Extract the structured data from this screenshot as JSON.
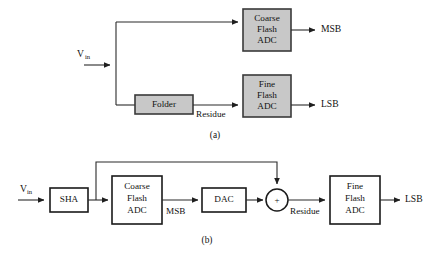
{
  "figure": {
    "background_color": "#ffffff",
    "line_color": "#2b2b2b",
    "gray_fill": "#c8c8c8",
    "white_fill": "#ffffff"
  },
  "diagram_a": {
    "caption": "(a)",
    "input_label": "V",
    "input_subscript": "in",
    "blocks": {
      "coarse": {
        "line1": "Coarse",
        "line2": "Flash",
        "line3": "ADC"
      },
      "fine": {
        "line1": "Fine",
        "line2": "Flash",
        "line3": "ADC"
      },
      "folder": {
        "line1": "Folder"
      }
    },
    "wire_labels": {
      "residue": "Residue"
    },
    "outputs": {
      "msb": "MSB",
      "lsb": "LSB"
    }
  },
  "diagram_b": {
    "caption": "(b)",
    "input_label": "V",
    "input_subscript": "in",
    "blocks": {
      "sha": {
        "line1": "SHA"
      },
      "coarse": {
        "line1": "Coarse",
        "line2": "Flash",
        "line3": "ADC"
      },
      "dac": {
        "line1": "DAC"
      },
      "fine": {
        "line1": "Fine",
        "line2": "Flash",
        "line3": "ADC"
      }
    },
    "summing_node": {
      "sign": "+"
    },
    "wire_labels": {
      "msb": "MSB",
      "residue": "Residue"
    },
    "outputs": {
      "lsb": "LSB"
    }
  }
}
